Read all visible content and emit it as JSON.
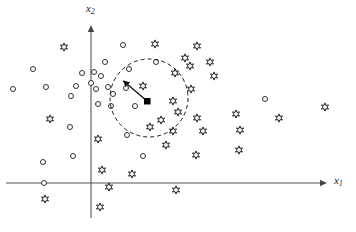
{
  "figure": {
    "title": "",
    "type": "scatter",
    "background_color": "#ffffff",
    "ink_color": "#1a1a1a"
  },
  "axes": {
    "x_axis": {
      "label": "x",
      "subscript": "1",
      "label_x": 334,
      "label_y": 175,
      "start": [
        6,
        183
      ],
      "end": [
        330,
        183
      ],
      "arrow": true
    },
    "y_axis": {
      "label": "x",
      "subscript": "2",
      "label_x": 86,
      "label_y": 3,
      "start": [
        91,
        218
      ],
      "end": [
        91,
        22
      ],
      "arrow": true
    },
    "origin": [
      91,
      183
    ]
  },
  "annotations": {
    "query_point": {
      "name": "query-point",
      "shape": "filled-square",
      "x": 147,
      "y": 101,
      "size": 6,
      "color": "#000000"
    },
    "radius_arrow": {
      "name": "radius-arrow",
      "from": [
        147,
        101
      ],
      "to": [
        121,
        79
      ],
      "arrowhead": "filled-triangle"
    },
    "neighborhood_circle": {
      "name": "neighborhood-circle",
      "cx": 149,
      "cy": 98,
      "r": 39,
      "style": "dashed",
      "dash": "4 3",
      "stroke_width": 1
    }
  },
  "chart_data": {
    "type": "scatter",
    "title": "",
    "xlabel": "x1",
    "ylabel": "x2",
    "grid": false,
    "legend_position": "none",
    "series": [
      {
        "name": "circle-class",
        "marker": "open-circle",
        "marker_size": 5,
        "count": 31,
        "points": [
          [
            33,
            69
          ],
          [
            13,
            89
          ],
          [
            46,
            87
          ],
          [
            76,
            86
          ],
          [
            71,
            96
          ],
          [
            82,
            73
          ],
          [
            91,
            83
          ],
          [
            94,
            72
          ],
          [
            96,
            89
          ],
          [
            101,
            76
          ],
          [
            108,
            87
          ],
          [
            113,
            94
          ],
          [
            98,
            104
          ],
          [
            105,
            62
          ],
          [
            111,
            106
          ],
          [
            126,
            88
          ],
          [
            123,
            45
          ],
          [
            129,
            69
          ],
          [
            135,
            106
          ],
          [
            127,
            135
          ],
          [
            143,
            156
          ],
          [
            156,
            62
          ],
          [
            70,
            127
          ],
          [
            73,
            156
          ],
          [
            43,
            162
          ],
          [
            265,
            99
          ],
          [
            44,
            183
          ]
        ]
      },
      {
        "name": "star-class",
        "marker": "open-six-point-star",
        "marker_size": 7,
        "count": 33,
        "points": [
          [
            64,
            47
          ],
          [
            50,
            119
          ],
          [
            98,
            139
          ],
          [
            102,
            170
          ],
          [
            109,
            187
          ],
          [
            100,
            207
          ],
          [
            45,
            199
          ],
          [
            132,
            174
          ],
          [
            143,
            86
          ],
          [
            150,
            127
          ],
          [
            161,
            120
          ],
          [
            173,
            131
          ],
          [
            176,
            190
          ],
          [
            185,
            58
          ],
          [
            173,
            101
          ],
          [
            178,
            112
          ],
          [
            166,
            145
          ],
          [
            175,
            73
          ],
          [
            190,
            66
          ],
          [
            191,
            89
          ],
          [
            197,
            46
          ],
          [
            197,
            118
          ],
          [
            203,
            131
          ],
          [
            214,
            76
          ],
          [
            196,
            155
          ],
          [
            236,
            114
          ],
          [
            239,
            150
          ],
          [
            325,
            107
          ],
          [
            279,
            118
          ],
          [
            240,
            130
          ],
          [
            155,
            44
          ],
          [
            210,
            62
          ]
        ]
      }
    ]
  }
}
